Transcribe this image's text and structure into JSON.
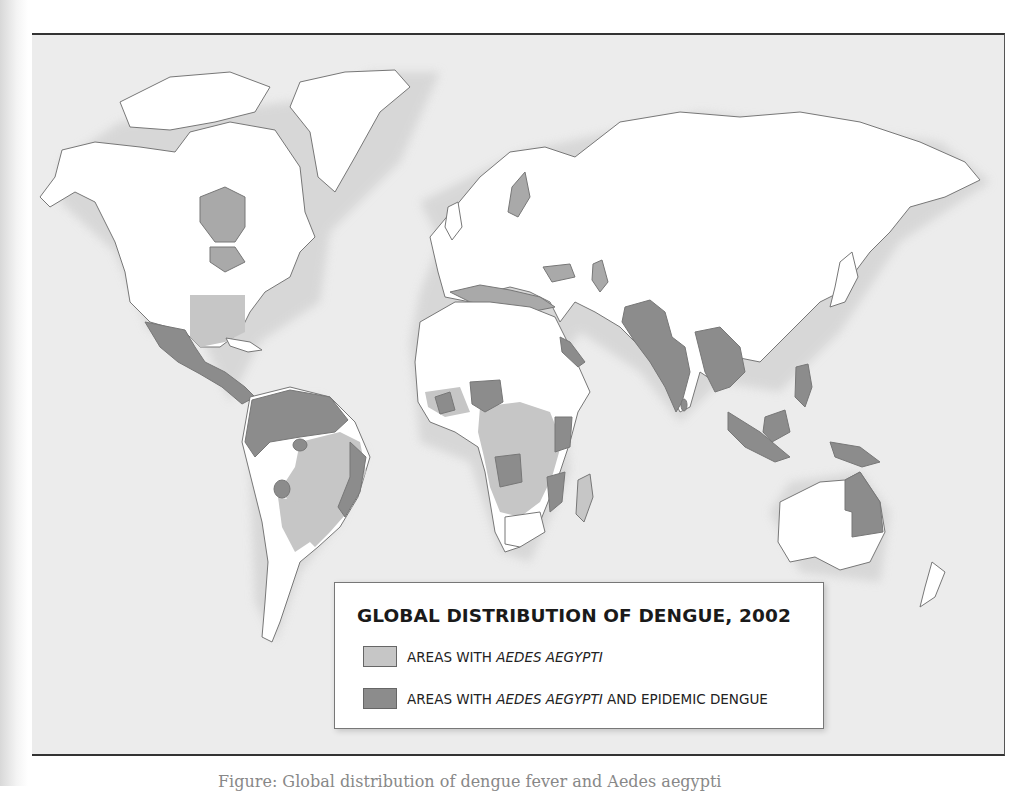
{
  "map": {
    "title": "GLOBAL DISTRIBUTION OF DENGUE, 2002",
    "colors": {
      "ocean": "#ececec",
      "land": "#ffffff",
      "inland_water": "#a9a9a9",
      "aedes_aegypti": "#c6c6c6",
      "epidemic_dengue": "#8c8c8c",
      "border": "#777777"
    },
    "legend": {
      "items": [
        {
          "prefix": "AREAS WITH ",
          "italic": "AEDES AEGYPTI",
          "suffix": "",
          "color": "#c6c6c6"
        },
        {
          "prefix": "AREAS WITH ",
          "italic": "AEDES AEGYPTI",
          "suffix": " AND EPIDEMIC DENGUE",
          "color": "#8c8c8c"
        }
      ]
    },
    "regions_epidemic_dengue": [
      "Mexico",
      "Central America",
      "Caribbean",
      "Northern South America",
      "Eastern Brazil",
      "West Africa",
      "Nigeria",
      "Angola",
      "East Africa",
      "Red Sea coast",
      "Pakistan",
      "India",
      "Sri Lanka",
      "Southeast Asia",
      "Philippines",
      "Indonesia",
      "Papua New Guinea",
      "Northeast Australia"
    ],
    "regions_aedes_aegypti": [
      "Southeastern United States",
      "Brazil interior",
      "Paraguay",
      "Northern Argentina",
      "Central Africa",
      "Southern Africa",
      "Madagascar"
    ]
  },
  "caption": "Figure: Global distribution of dengue fever and Aedes aegypti"
}
